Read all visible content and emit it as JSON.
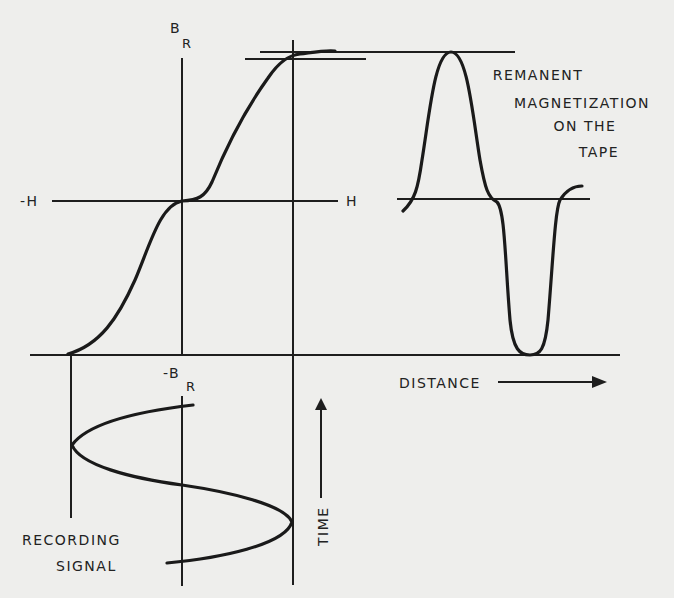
{
  "diagram": {
    "labels": {
      "br_top": "B",
      "br_top_sub": "R",
      "neg_h": "-H",
      "pos_h": "H",
      "neg_br": "-B",
      "neg_br_sub": "R",
      "remanent_line1": "REMANENT",
      "remanent_line2": "MAGNETIZATION",
      "remanent_line3": "ON THE",
      "remanent_line4": "TAPE",
      "distance": "DISTANCE",
      "time": "TIME",
      "recording_line1": "RECORDING",
      "recording_line2": "SIGNAL"
    },
    "panels": [
      {
        "name": "transfer-curve",
        "description": "B_R vs H S-shaped remanence curve"
      },
      {
        "name": "tape-magnetization",
        "description": "remanent magnetization vs distance along tape"
      },
      {
        "name": "recording-signal",
        "description": "sinusoidal recording signal vs time"
      }
    ],
    "colors": {
      "background": "#eeeeec",
      "ink": "#1e1e1e"
    }
  }
}
